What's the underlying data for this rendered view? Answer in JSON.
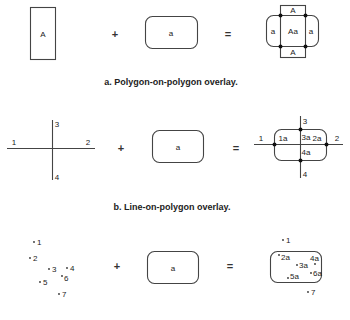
{
  "panels": {
    "a": {
      "caption": "a. Polygon-on-polygon overlay.",
      "input1_label": "A",
      "operator1": "+",
      "input2_label": "a",
      "operator2": "=",
      "result": {
        "top": "A",
        "bottom": "A",
        "left": "a",
        "center": "Aa",
        "right": "a"
      }
    },
    "b": {
      "caption": "b. Line-on-polygon overlay.",
      "input1": {
        "labels": [
          "1",
          "2",
          "3",
          "4"
        ]
      },
      "operator1": "+",
      "input2_label": "a",
      "operator2": "=",
      "result": {
        "outside": [
          "1",
          "2",
          "3",
          "4"
        ],
        "inside": [
          "1a",
          "2a",
          "3a",
          "4a"
        ]
      }
    },
    "c": {
      "caption": "",
      "input1": {
        "points": [
          "1",
          "2",
          "3",
          "4",
          "5",
          "6",
          "7"
        ]
      },
      "operator1": "+",
      "input2_label": "a",
      "operator2": "=",
      "result": {
        "outside": [
          "1",
          "7"
        ],
        "inside": [
          "2a",
          "3a",
          "4a",
          "5a",
          "6a"
        ]
      }
    }
  }
}
